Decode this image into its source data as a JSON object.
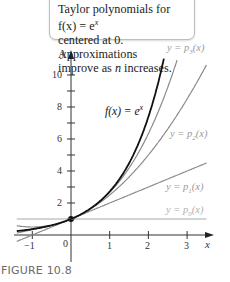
{
  "callout": {
    "line1": "Taylor polynomials for f(x) = e",
    "line1_sup": "x",
    "line2": "centered at 0. Approximations",
    "line3_pre": "improve as ",
    "line3_var": "n",
    "line3_post": " increases."
  },
  "figure_label": "FIGURE 10.8",
  "chart_data": {
    "type": "line",
    "xlabel": "x",
    "ylabel": "y",
    "xlim": [
      -1.4,
      3.6
    ],
    "ylim": [
      -0.4,
      11.5
    ],
    "x_ticks": [
      -1,
      0,
      1,
      2,
      3
    ],
    "y_ticks_labeled": [
      2,
      4,
      6,
      8,
      10
    ],
    "y_ticks_minor": [
      1,
      3,
      5,
      7,
      9
    ],
    "grid": false,
    "series": [
      {
        "name": "f(x) = e^x",
        "formula": "exp(x)",
        "color": "#111111",
        "width": 1.8,
        "x_range": [
          -1.4,
          2.4
        ]
      },
      {
        "name": "y = p3(x)",
        "formula": "1 + x + x^2/2 + x^3/6",
        "color": "#8a8a8a",
        "width": 1.2,
        "x_range": [
          -1.4,
          2.75
        ]
      },
      {
        "name": "y = p2(x)",
        "formula": "1 + x + x^2/2",
        "color": "#8a8a8a",
        "width": 1.2,
        "x_range": [
          -1.4,
          3.5
        ]
      },
      {
        "name": "y = p1(x)",
        "formula": "1 + x",
        "color": "#8a8a8a",
        "width": 1.2,
        "x_range": [
          -1.4,
          3.5
        ]
      },
      {
        "name": "y = p0(x)",
        "formula": "1",
        "color": "#a8a8a8",
        "width": 1.2,
        "x_range": [
          -1.4,
          3.5
        ]
      }
    ],
    "point": {
      "x": 0,
      "y": 1
    },
    "curve_labels": [
      {
        "text": "y = p3(x)",
        "x": 2.55,
        "y": 11.8
      },
      {
        "text": "y = p2(x)",
        "x": 2.6,
        "y": 6.2
      },
      {
        "text": "y = p1(x)",
        "x": 2.5,
        "y": 3.0
      },
      {
        "text": "y = p0(x)",
        "x": 2.5,
        "y": 1.5
      },
      {
        "text": "f(x) = e^x",
        "x": 0.9,
        "y": 7.9
      }
    ]
  },
  "labels": {
    "p3": {
      "pre": "y = ",
      "p": "p",
      "sub": "3",
      "post": "(x)"
    },
    "p2": {
      "pre": "y = ",
      "p": "p",
      "sub": "2",
      "post": "(x)"
    },
    "p1": {
      "pre": "y = ",
      "p": "p",
      "sub": "1",
      "post": "(x)"
    },
    "p0": {
      "pre": "y = ",
      "p": "p",
      "sub": "0",
      "post": "(x)"
    },
    "f": {
      "text": "f(x) = e",
      "sup": "x"
    },
    "x_axis": "x",
    "y_axis": "y",
    "x_ticks": [
      "−1",
      "0",
      "1",
      "2",
      "3"
    ],
    "y_ticks": [
      "2",
      "4",
      "6",
      "8",
      "10"
    ]
  }
}
